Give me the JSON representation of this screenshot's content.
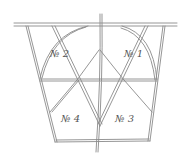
{
  "diagram": {
    "type": "engraved geometric figure",
    "colors": {
      "background": "#ffffff",
      "line": "#8a8a8a",
      "text": "#555555"
    },
    "regions": [
      {
        "id": "r1",
        "label": "№ 1",
        "x": 136,
        "y": 53
      },
      {
        "id": "r2",
        "label": "№ 2",
        "x": 64,
        "y": 53
      },
      {
        "id": "r3",
        "label": "№ 3",
        "x": 125,
        "y": 119
      },
      {
        "id": "r4",
        "label": "№ 4",
        "x": 71,
        "y": 119
      }
    ]
  }
}
